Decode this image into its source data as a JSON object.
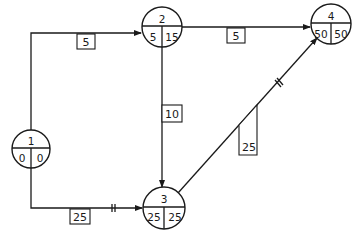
{
  "diagram": {
    "type": "activity-on-arrow network (CPM)",
    "nodes": [
      {
        "id": "1",
        "early": "0",
        "late": "0"
      },
      {
        "id": "2",
        "early": "5",
        "late": "15"
      },
      {
        "id": "3",
        "early": "25",
        "late": "25"
      },
      {
        "id": "4",
        "early": "50",
        "late": "50"
      }
    ],
    "edges": [
      {
        "from": "1",
        "to": "2",
        "duration": "5",
        "critical": false
      },
      {
        "from": "1",
        "to": "3",
        "duration": "25",
        "critical": true
      },
      {
        "from": "2",
        "to": "3",
        "duration": "10",
        "critical": false
      },
      {
        "from": "2",
        "to": "4",
        "duration": "5",
        "critical": false
      },
      {
        "from": "3",
        "to": "4",
        "duration": "25",
        "critical": true
      }
    ],
    "critical_marker": "||"
  }
}
